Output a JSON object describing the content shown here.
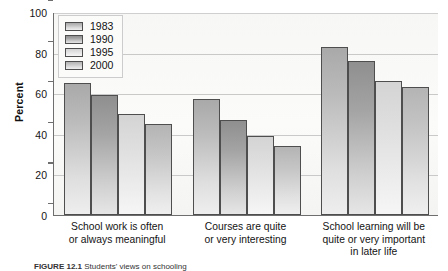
{
  "figure": {
    "caption_lead": "FIGURE 12.1",
    "caption_text": "Students' views on schooling"
  },
  "axis": {
    "ylabel": "Percent",
    "yticks": [
      "0",
      "20",
      "40",
      "60",
      "80",
      "100"
    ]
  },
  "legend": {
    "entries": [
      {
        "label": "1983",
        "swatch": "legend-swatch-1983"
      },
      {
        "label": "1990",
        "swatch": "legend-swatch-1990"
      },
      {
        "label": "1995",
        "swatch": "legend-swatch-1995"
      },
      {
        "label": "2000",
        "swatch": "legend-swatch-2000"
      }
    ]
  },
  "categories": [
    {
      "line1": "School work is often",
      "line2": "or always meaningful",
      "line3": ""
    },
    {
      "line1": "Courses are quite",
      "line2": "or very interesting",
      "line3": ""
    },
    {
      "line1": "School learning will be",
      "line2": "quite or very important",
      "line3": "in later life"
    }
  ],
  "chart_data": {
    "type": "bar",
    "title": "",
    "xlabel": "",
    "ylabel": "Percent",
    "ylim": [
      0,
      100
    ],
    "ytick_step": 20,
    "grid": true,
    "legend_position": "top-left inside plot",
    "categories": [
      "School work is often or always meaningful",
      "Courses are quite or very interesting",
      "School learning will be quite or very important in later life"
    ],
    "series": [
      {
        "name": "1983",
        "values": [
          65,
          57,
          83
        ]
      },
      {
        "name": "1990",
        "values": [
          59,
          47,
          76
        ]
      },
      {
        "name": "1995",
        "values": [
          50,
          39,
          66
        ]
      },
      {
        "name": "2000",
        "values": [
          45,
          34,
          63
        ]
      }
    ]
  }
}
